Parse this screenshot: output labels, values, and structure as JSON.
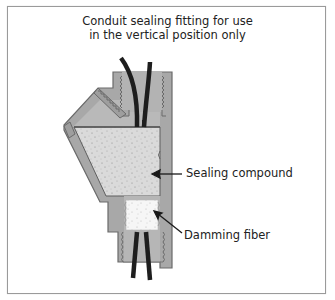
{
  "title": {
    "line1": "Conduit sealing fitting for use",
    "line2": "in the vertical position only"
  },
  "labels": {
    "sealing_compound": "Sealing compound",
    "damming_fiber": "Damming fiber"
  },
  "colors": {
    "fitting_body": "#a9a9a9",
    "fitting_edge": "#6e6e6e",
    "fitting_light": "#c4c4c4",
    "compound": "#d9d9d9",
    "fiber": "#f4f4f4",
    "wire": "#1e1e1e",
    "frame": "#9a9a9a"
  }
}
